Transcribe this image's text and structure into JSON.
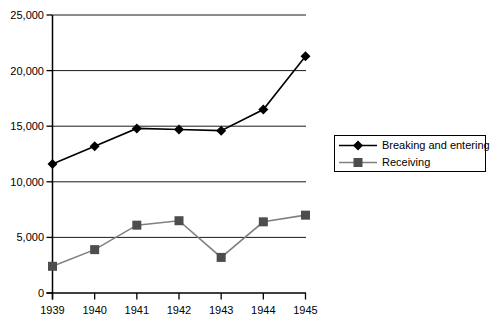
{
  "colors": {
    "background": "#ffffff",
    "axis": "#000000",
    "grid": "#1a1a1a",
    "text": "#000000",
    "legend_border": "#000000"
  },
  "chart_data": {
    "type": "line",
    "title": "",
    "xlabel": "",
    "ylabel": "",
    "categories": [
      "1939",
      "1940",
      "1941",
      "1942",
      "1943",
      "1944",
      "1945"
    ],
    "series": [
      {
        "name": "Breaking and entering",
        "values": [
          11600,
          13200,
          14800,
          14700,
          14600,
          16500,
          21300
        ],
        "color": "#000000",
        "marker": "diamond",
        "marker_color": "#000000"
      },
      {
        "name": "Receiving",
        "values": [
          2400,
          3900,
          6100,
          6500,
          3200,
          6400,
          7000
        ],
        "color": "#808080",
        "marker": "square",
        "marker_color": "#4d4d4d"
      }
    ],
    "ylim": [
      0,
      25000
    ],
    "ytick_interval": 5000,
    "ytick_labels": [
      "0",
      "5,000",
      "10,000",
      "15,000",
      "20,000",
      "25,000"
    ],
    "grid": true,
    "legend_position": "right"
  }
}
